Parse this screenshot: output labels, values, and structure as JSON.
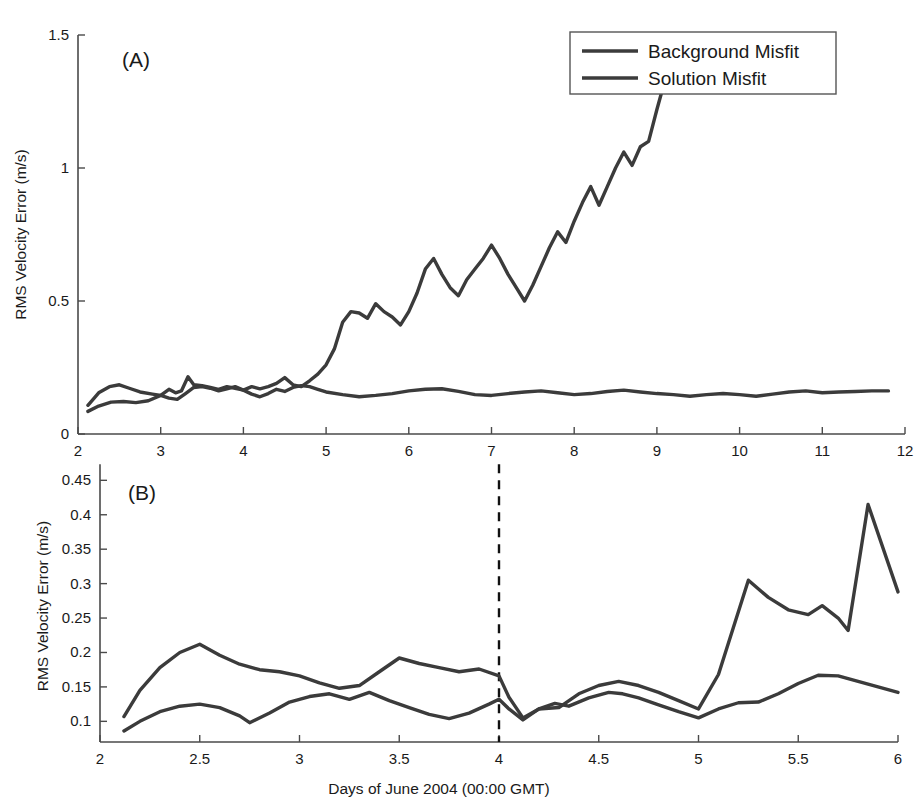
{
  "figure": {
    "background_color": "#ffffff",
    "line_color": "#3b3b3b",
    "axis_color": "#4a4a4a",
    "event_line_color": "#111111",
    "shared_xlabel": "Days of June 2004 (00:00 GMT)",
    "legend": {
      "position": "top-right of panel A",
      "entries": [
        {
          "label": "Background Misfit",
          "color": "#3b3b3b"
        },
        {
          "label": "Solution Misfit",
          "color": "#3b3b3b"
        }
      ]
    }
  },
  "chart_data": [
    {
      "type": "line",
      "panel": "A",
      "panel_label": "(A)",
      "title": "",
      "xlabel": "",
      "ylabel": "RMS Velocity Error (m/s)",
      "xlim": [
        2,
        12
      ],
      "ylim": [
        0,
        1.5
      ],
      "xticks": [
        2,
        3,
        4,
        5,
        6,
        7,
        8,
        9,
        10,
        11,
        12
      ],
      "xticklabels": [
        "2",
        "3",
        "4",
        "5",
        "6",
        "7",
        "8",
        "9",
        "10",
        "11",
        "12"
      ],
      "yticks": [
        0,
        0.5,
        1,
        1.5
      ],
      "yticklabels": [
        "0",
        "0.5",
        "1",
        "1.5"
      ],
      "grid": false,
      "legend": [
        "Background Misfit",
        "Solution Misfit"
      ],
      "series": [
        {
          "name": "Background Misfit",
          "color": "#3b3b3b",
          "x": [
            2.12,
            2.25,
            2.38,
            2.5,
            2.62,
            2.75,
            2.9,
            3.0,
            3.1,
            3.18,
            3.25,
            3.33,
            3.4,
            3.5,
            3.6,
            3.7,
            3.8,
            3.9,
            4.0,
            4.1,
            4.2,
            4.3,
            4.4,
            4.5,
            4.6,
            4.7,
            4.8,
            4.9,
            5.0,
            5.1,
            5.2,
            5.3,
            5.4,
            5.5,
            5.6,
            5.7,
            5.8,
            5.9,
            6.0,
            6.1,
            6.2,
            6.3,
            6.4,
            6.5,
            6.6,
            6.7,
            6.8,
            6.9,
            7.0,
            7.1,
            7.2,
            7.3,
            7.4,
            7.5,
            7.6,
            7.7,
            7.8,
            7.9,
            8.0,
            8.1,
            8.2,
            8.3,
            8.4,
            8.5,
            8.6,
            8.7,
            8.8,
            8.9,
            9.0,
            9.08
          ],
          "y": [
            0.108,
            0.155,
            0.178,
            0.185,
            0.172,
            0.158,
            0.15,
            0.145,
            0.168,
            0.155,
            0.162,
            0.215,
            0.185,
            0.182,
            0.175,
            0.168,
            0.178,
            0.172,
            0.165,
            0.178,
            0.17,
            0.178,
            0.19,
            0.212,
            0.185,
            0.178,
            0.2,
            0.225,
            0.26,
            0.32,
            0.42,
            0.46,
            0.455,
            0.435,
            0.49,
            0.46,
            0.44,
            0.41,
            0.46,
            0.53,
            0.62,
            0.66,
            0.6,
            0.55,
            0.52,
            0.58,
            0.62,
            0.66,
            0.71,
            0.66,
            0.6,
            0.55,
            0.5,
            0.56,
            0.63,
            0.7,
            0.76,
            0.72,
            0.8,
            0.87,
            0.93,
            0.86,
            0.93,
            1.0,
            1.06,
            1.01,
            1.08,
            1.1,
            1.22,
            1.31
          ]
        },
        {
          "name": "Solution Misfit",
          "color": "#3b3b3b",
          "x": [
            2.12,
            2.25,
            2.4,
            2.55,
            2.7,
            2.85,
            3.0,
            3.1,
            3.2,
            3.3,
            3.4,
            3.5,
            3.6,
            3.7,
            3.8,
            3.9,
            4.0,
            4.1,
            4.2,
            4.3,
            4.4,
            4.5,
            4.6,
            4.7,
            4.8,
            4.9,
            5.0,
            5.2,
            5.4,
            5.6,
            5.8,
            6.0,
            6.2,
            6.4,
            6.6,
            6.8,
            7.0,
            7.2,
            7.4,
            7.6,
            7.8,
            8.0,
            8.2,
            8.4,
            8.6,
            8.8,
            9.0,
            9.2,
            9.4,
            9.6,
            9.8,
            10.0,
            10.2,
            10.4,
            10.6,
            10.8,
            11.0,
            11.2,
            11.4,
            11.6,
            11.8
          ],
          "y": [
            0.085,
            0.105,
            0.12,
            0.122,
            0.118,
            0.125,
            0.145,
            0.135,
            0.13,
            0.152,
            0.175,
            0.178,
            0.172,
            0.162,
            0.17,
            0.178,
            0.165,
            0.15,
            0.14,
            0.152,
            0.168,
            0.16,
            0.175,
            0.182,
            0.178,
            0.168,
            0.158,
            0.148,
            0.14,
            0.145,
            0.152,
            0.162,
            0.168,
            0.17,
            0.16,
            0.148,
            0.145,
            0.152,
            0.158,
            0.162,
            0.155,
            0.148,
            0.152,
            0.16,
            0.165,
            0.158,
            0.152,
            0.148,
            0.142,
            0.148,
            0.152,
            0.148,
            0.142,
            0.15,
            0.158,
            0.162,
            0.155,
            0.158,
            0.16,
            0.162,
            0.162
          ]
        }
      ]
    },
    {
      "type": "line",
      "panel": "B",
      "panel_label": "(B)",
      "title": "",
      "xlabel": "Days of June 2004 (00:00 GMT)",
      "ylabel": "RMS Velocity Error (m/s)",
      "xlim": [
        2,
        6
      ],
      "ylim": [
        0.07,
        0.465
      ],
      "xticks": [
        2,
        2.5,
        3,
        3.5,
        4,
        4.5,
        5,
        5.5,
        6
      ],
      "xticklabels": [
        "2",
        "2.5",
        "3",
        "3.5",
        "4",
        "4.5",
        "5",
        "5.5",
        "6"
      ],
      "yticks": [
        0.1,
        0.15,
        0.2,
        0.25,
        0.3,
        0.35,
        0.4,
        0.45
      ],
      "yticklabels": [
        "0.1",
        "0.15",
        "0.2",
        "0.25",
        "0.3",
        "0.35",
        "0.4",
        "0.45"
      ],
      "grid": false,
      "annotations": [
        {
          "type": "vline",
          "x": 4,
          "style": "dashed",
          "color": "#111111",
          "label": "analysis start day 4"
        }
      ],
      "series": [
        {
          "name": "Background Misfit",
          "color": "#3b3b3b",
          "x": [
            2.12,
            2.2,
            2.3,
            2.4,
            2.5,
            2.6,
            2.7,
            2.8,
            2.9,
            3.0,
            3.1,
            3.2,
            3.3,
            3.4,
            3.5,
            3.6,
            3.7,
            3.8,
            3.9,
            4.0,
            4.05,
            4.12,
            4.2,
            4.3,
            4.4,
            4.5,
            4.6,
            4.7,
            4.8,
            4.9,
            5.0,
            5.1,
            5.25,
            5.35,
            5.45,
            5.55,
            5.62,
            5.7,
            5.75,
            5.85,
            6.0
          ],
          "y": [
            0.107,
            0.145,
            0.178,
            0.2,
            0.212,
            0.196,
            0.183,
            0.175,
            0.172,
            0.166,
            0.156,
            0.148,
            0.152,
            0.172,
            0.192,
            0.184,
            0.178,
            0.172,
            0.176,
            0.166,
            0.135,
            0.105,
            0.118,
            0.12,
            0.14,
            0.152,
            0.158,
            0.152,
            0.142,
            0.13,
            0.118,
            0.168,
            0.305,
            0.28,
            0.262,
            0.255,
            0.268,
            0.25,
            0.232,
            0.415,
            0.288
          ]
        },
        {
          "name": "Solution Misfit",
          "color": "#3b3b3b",
          "x": [
            2.12,
            2.2,
            2.3,
            2.4,
            2.5,
            2.6,
            2.7,
            2.75,
            2.85,
            2.95,
            3.05,
            3.15,
            3.25,
            3.35,
            3.45,
            3.55,
            3.65,
            3.75,
            3.85,
            3.95,
            4.0,
            4.05,
            4.12,
            4.2,
            4.28,
            4.35,
            4.45,
            4.55,
            4.62,
            4.7,
            4.8,
            4.9,
            5.0,
            5.1,
            5.2,
            5.3,
            5.4,
            5.5,
            5.6,
            5.7,
            5.8,
            5.9,
            6.0
          ],
          "y": [
            0.086,
            0.1,
            0.114,
            0.122,
            0.125,
            0.12,
            0.108,
            0.098,
            0.112,
            0.128,
            0.136,
            0.14,
            0.132,
            0.142,
            0.13,
            0.12,
            0.11,
            0.104,
            0.112,
            0.125,
            0.132,
            0.118,
            0.102,
            0.118,
            0.126,
            0.122,
            0.134,
            0.142,
            0.14,
            0.134,
            0.124,
            0.114,
            0.105,
            0.118,
            0.127,
            0.128,
            0.14,
            0.155,
            0.167,
            0.166,
            0.158,
            0.15,
            0.142
          ]
        }
      ]
    }
  ]
}
